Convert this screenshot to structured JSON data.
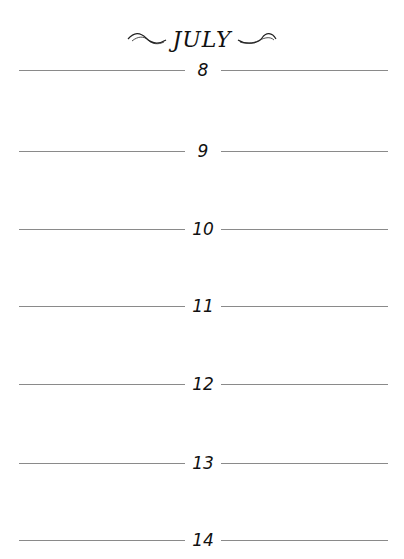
{
  "page": {
    "month": "JULY",
    "days": [
      {
        "label": "8",
        "top": 58
      },
      {
        "label": "9",
        "top": 139
      },
      {
        "label": "10",
        "top": 217
      },
      {
        "label": "11",
        "top": 294
      },
      {
        "label": "12",
        "top": 372
      },
      {
        "label": "13",
        "top": 451
      },
      {
        "label": "14",
        "top": 528
      }
    ]
  }
}
